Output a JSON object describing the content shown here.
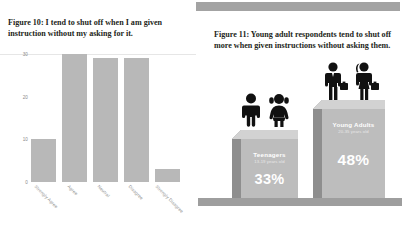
{
  "left_figure": {
    "title": "Figure 10: I tend to shut off when I am given instruction without my asking for it.",
    "ytick_labels": [
      "0",
      "10",
      "20",
      "30"
    ]
  },
  "right_figure": {
    "title": "Figure 11: Young adult respondents tend to shut off more when given instructions without asking them."
  },
  "chart_data": [
    {
      "type": "bar",
      "title": "Figure 10: I tend to shut off when I am given instruction without my asking for it.",
      "categories": [
        "Strongly Agree",
        "Agree",
        "Neutral",
        "Disagree",
        "Strongly Disagree"
      ],
      "values": [
        10,
        30,
        29,
        29,
        3
      ],
      "xlabel": "",
      "ylabel": "",
      "ylim": [
        0,
        30
      ],
      "yticks": [
        0,
        10,
        20,
        30
      ],
      "grid": true,
      "legend": "none",
      "bar_color": "#b8b8b8"
    },
    {
      "type": "bar",
      "title": "Figure 11: Young adult respondents tend to shut off more when given instructions without asking them.",
      "categories": [
        "Teenagers",
        "Young Adults"
      ],
      "values": [
        33,
        48
      ],
      "value_labels": [
        "33%",
        "48%"
      ],
      "category_sublabels": [
        "13-19 years old",
        "20-35 years old"
      ],
      "icons": [
        "teen-boy-girl-icon",
        "adult-man-woman-icon"
      ],
      "xlabel": "",
      "ylabel": "",
      "ylim": [
        0,
        60
      ],
      "grid": false,
      "legend": "none",
      "bar_color": "#bdbdbd"
    }
  ],
  "colors": {
    "bar_gray": "#b8b8b8",
    "column_face": "#bdbdbd",
    "column_top": "#d2d2d2",
    "column_side": "#8e8e8e",
    "ground": "#9e9e9e",
    "accent_bar": "#a3a3a3",
    "title_text": "#231f20"
  }
}
